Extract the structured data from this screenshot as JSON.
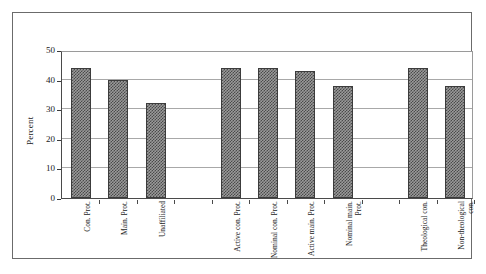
{
  "chart_data": {
    "type": "bar",
    "title": "",
    "subtitle": "",
    "xlabel": "",
    "ylabel": "Percent",
    "ylim": [
      0,
      50
    ],
    "yticks": [
      0,
      10,
      20,
      30,
      40,
      50
    ],
    "ytick_labels": [
      "0",
      "10",
      "20",
      "30",
      "40",
      "50"
    ],
    "grid": true,
    "legend": "none",
    "orientation": "vertical",
    "bar_fill": "gray-checkered-hatch",
    "categories": [
      "Con. Prot.",
      "Main. Prot.",
      "Unaffiliated",
      "",
      "Active con. Prot.",
      "Nominal con. Prot.",
      "Active main. Prot.",
      "Nominal main. Prot.",
      "",
      "Theological con.",
      "Non-theological con."
    ],
    "values": [
      44,
      40,
      32,
      null,
      44,
      44,
      43,
      38,
      null,
      44,
      38
    ],
    "groups": [
      {
        "name": "Religious tradition",
        "categories": [
          "Con. Prot.",
          "Main. Prot.",
          "Unaffiliated"
        ],
        "values": [
          44,
          40,
          32
        ]
      },
      {
        "name": "Attendance",
        "categories": [
          "Active con. Prot.",
          "Nominal con. Prot.",
          "Active main. Prot.",
          "Nominal main. Prot."
        ],
        "values": [
          44,
          44,
          43,
          38
        ]
      },
      {
        "name": "Theology",
        "categories": [
          "Theological con.",
          "Non-theological con."
        ],
        "values": [
          44,
          38
        ]
      }
    ]
  },
  "colors": {
    "bar_fill_dark": "#4a4a4a",
    "bar_fill_light": "#9a9a9a",
    "bar_border": "#3c3c3c",
    "gridline": "#a8a8a8",
    "axis": "#4a4a4a",
    "frame": "#6b6b6b",
    "text": "#1a1a1a",
    "background": "#ffffff"
  }
}
